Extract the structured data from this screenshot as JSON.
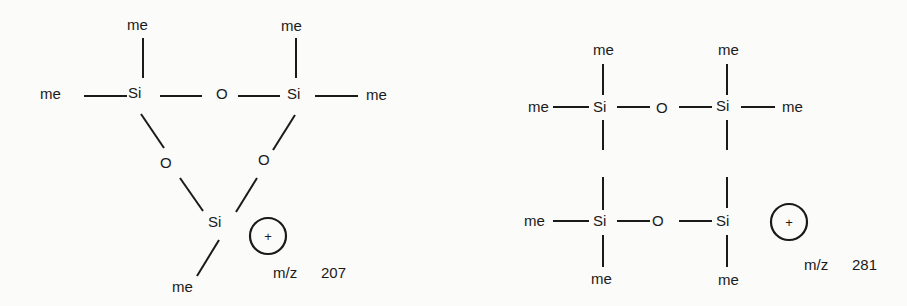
{
  "structures": [
    {
      "name": "cyclic-trisiloxane-ion",
      "atoms": {
        "me_top_left": "me",
        "me_left": "me",
        "si_left": "Si",
        "o_top": "O",
        "si_right": "Si",
        "me_top_right": "me",
        "me_right": "me",
        "o_lower_left": "O",
        "o_lower_right": "O",
        "si_bottom": "Si",
        "me_bottom": "me"
      },
      "charge": "+",
      "mz_label": "m/z",
      "mz_value": "207"
    },
    {
      "name": "siloxane-ion-281",
      "atoms": {
        "me_top_left": "me",
        "me_top_right": "me",
        "me_left_upper": "me",
        "si_upper_left": "Si",
        "o_upper": "O",
        "si_upper_right": "Si",
        "me_right_upper": "me",
        "me_left_lower": "me",
        "si_lower_left": "Si",
        "o_lower": "O",
        "si_lower_right": "Si",
        "me_bottom_left": "me",
        "me_bottom_right": "me"
      },
      "charge": "+",
      "mz_label": "m/z",
      "mz_value": "281"
    }
  ]
}
